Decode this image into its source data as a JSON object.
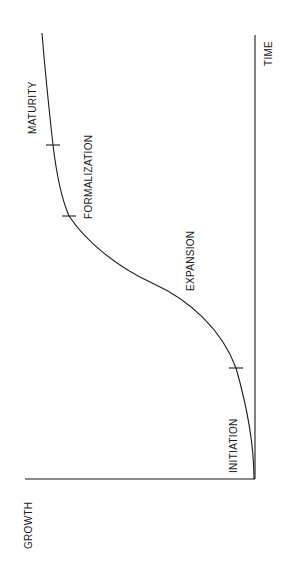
{
  "diagram": {
    "type": "growth-curve",
    "orientation": "rotated 90deg clockwise",
    "axes": {
      "y_label": "GROWTH",
      "x_label": "TIME"
    },
    "stages": [
      {
        "label": "INITIATION"
      },
      {
        "label": "EXPANSION"
      },
      {
        "label": "FORMALIZATION"
      },
      {
        "label": "MATURITY"
      }
    ],
    "stroke_color": "#1a1a1a",
    "background": "#ffffff"
  }
}
